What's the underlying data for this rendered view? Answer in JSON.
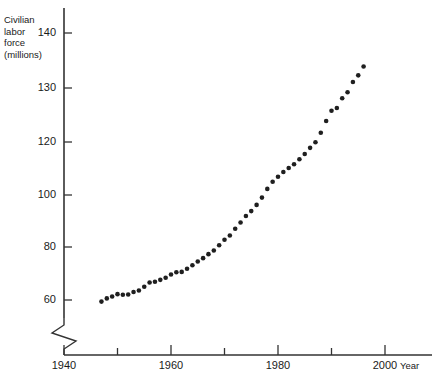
{
  "chart_data": {
    "type": "scatter",
    "title": "",
    "ylabel": "Civilian\nlabor\nforce\n(millions)",
    "xlabel": "Year",
    "xlim": [
      1940,
      2005
    ],
    "ylim": [
      56,
      144
    ],
    "grid": false,
    "legend": "none",
    "axis_break": {
      "axis": "y",
      "symbol": "zigzag",
      "note": "y-axis broken below 60"
    },
    "y_ticks": [
      60,
      80,
      100,
      120,
      130,
      140
    ],
    "y_tick_labels": [
      "60",
      "80",
      "100",
      "120",
      "130",
      "140"
    ],
    "x_ticks": [
      1940,
      1950,
      1960,
      1970,
      1980,
      1990,
      2000
    ],
    "x_tick_labels": [
      "1940",
      "",
      "1960",
      "",
      "1980",
      "",
      "2000"
    ],
    "x_minor_ticks": [
      1950,
      1970,
      1990
    ],
    "marker": {
      "shape": "circle",
      "color": "#1f1f1f",
      "size": 4.6
    },
    "x": [
      1947,
      1948,
      1949,
      1950,
      1951,
      1952,
      1953,
      1954,
      1955,
      1956,
      1957,
      1958,
      1959,
      1960,
      1961,
      1962,
      1963,
      1964,
      1965,
      1966,
      1967,
      1968,
      1969,
      1970,
      1971,
      1972,
      1973,
      1974,
      1975,
      1976,
      1977,
      1978,
      1979,
      1980,
      1981,
      1982,
      1983,
      1984,
      1985,
      1986,
      1987,
      1988,
      1989,
      1990,
      1991,
      1992,
      1993,
      1994,
      1995,
      1996
    ],
    "values": [
      59.4,
      60.6,
      61.3,
      62.2,
      62.0,
      62.1,
      63.0,
      63.6,
      65.0,
      66.6,
      66.9,
      67.6,
      68.4,
      69.6,
      70.5,
      70.6,
      71.8,
      73.1,
      74.5,
      75.8,
      77.3,
      78.7,
      80.7,
      82.8,
      84.4,
      87.0,
      89.4,
      91.9,
      93.8,
      96.2,
      99.0,
      102.3,
      105.0,
      106.9,
      108.7,
      110.2,
      111.6,
      113.5,
      115.5,
      117.8,
      119.9,
      121.7,
      123.9,
      125.8,
      126.3,
      128.1,
      129.2,
      131.1,
      132.3,
      133.9
    ],
    "series_name": "Civilian labor force",
    "units": "millions of persons"
  }
}
